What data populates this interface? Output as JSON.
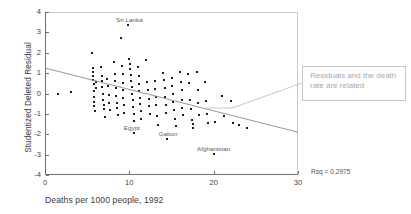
{
  "chart_data": {
    "type": "scatter",
    "title": "",
    "xlabel": "Deaths per 1000 people, 1992",
    "ylabel": "Studentized Deleted Residual",
    "xlim": [
      0,
      30
    ],
    "ylim": [
      -4,
      4
    ],
    "xticks": [
      0,
      10,
      20,
      30
    ],
    "yticks": [
      -4,
      -3,
      -2,
      -1,
      0,
      1,
      2,
      3,
      4
    ],
    "grid": false,
    "legend": null,
    "marker_color": "#1d1d1d",
    "fit_line": {
      "label": "regression fit",
      "x": [
        0,
        30
      ],
      "y": [
        1.25,
        -1.9
      ],
      "color": "#8a8a8a"
    },
    "statistics": {
      "rsq_label": "Rsq = 0.2975",
      "rsq_value": 0.2975
    },
    "point_labels": [
      {
        "text": "Sri Lanka",
        "x": 10.0,
        "y": 3.35
      },
      {
        "text": "Egypt",
        "x": 10.3,
        "y": -1.95
      },
      {
        "text": "Gabon",
        "x": 14.6,
        "y": -2.25
      },
      {
        "text": "Afghanistan",
        "x": 20.0,
        "y": -2.95
      }
    ],
    "points": [
      [
        1.6,
        0.0
      ],
      [
        3.1,
        0.05
      ],
      [
        5.6,
        2.0
      ],
      [
        5.7,
        1.25
      ],
      [
        5.7,
        1.05
      ],
      [
        5.7,
        0.85
      ],
      [
        5.7,
        0.65
      ],
      [
        5.8,
        0.45
      ],
      [
        5.8,
        0.1
      ],
      [
        5.8,
        -0.15
      ],
      [
        5.8,
        -0.4
      ],
      [
        5.8,
        -0.6
      ],
      [
        5.9,
        -0.85
      ],
      [
        6.0,
        0.55
      ],
      [
        6.1,
        0.25
      ],
      [
        6.6,
        1.3
      ],
      [
        6.7,
        0.85
      ],
      [
        6.8,
        0.6
      ],
      [
        6.8,
        0.3
      ],
      [
        6.9,
        0.0
      ],
      [
        6.9,
        -0.3
      ],
      [
        7.0,
        -0.55
      ],
      [
        7.0,
        -0.75
      ],
      [
        7.1,
        -1.15
      ],
      [
        7.4,
        0.7
      ],
      [
        7.5,
        0.35
      ],
      [
        7.6,
        -0.05
      ],
      [
        7.6,
        -0.45
      ],
      [
        7.7,
        -0.8
      ],
      [
        8.2,
        1.55
      ],
      [
        8.3,
        0.95
      ],
      [
        8.3,
        0.6
      ],
      [
        8.4,
        0.25
      ],
      [
        8.4,
        -0.1
      ],
      [
        8.5,
        -0.45
      ],
      [
        8.5,
        -0.7
      ],
      [
        8.6,
        -1.05
      ],
      [
        9.0,
        2.7
      ],
      [
        9.1,
        1.35
      ],
      [
        9.2,
        0.95
      ],
      [
        9.2,
        0.5
      ],
      [
        9.3,
        0.15
      ],
      [
        9.3,
        -0.2
      ],
      [
        9.4,
        -0.55
      ],
      [
        9.4,
        -0.95
      ],
      [
        9.9,
        3.35
      ],
      [
        10.0,
        1.7
      ],
      [
        10.1,
        1.45
      ],
      [
        10.1,
        1.2
      ],
      [
        10.2,
        0.9
      ],
      [
        10.2,
        0.6
      ],
      [
        10.3,
        0.3
      ],
      [
        10.3,
        0.0
      ],
      [
        10.4,
        -0.3
      ],
      [
        10.4,
        -0.65
      ],
      [
        10.5,
        -1.0
      ],
      [
        10.5,
        -1.35
      ],
      [
        10.6,
        -1.95
      ],
      [
        11.0,
        1.3
      ],
      [
        11.1,
        0.85
      ],
      [
        11.2,
        0.45
      ],
      [
        11.2,
        0.1
      ],
      [
        11.3,
        -0.2
      ],
      [
        11.3,
        -0.5
      ],
      [
        11.4,
        -0.85
      ],
      [
        11.4,
        -1.25
      ],
      [
        12.0,
        1.65
      ],
      [
        12.1,
        0.55
      ],
      [
        12.2,
        0.15
      ],
      [
        12.3,
        -0.25
      ],
      [
        12.3,
        -0.6
      ],
      [
        12.4,
        -1.0
      ],
      [
        13.0,
        0.6
      ],
      [
        13.1,
        0.2
      ],
      [
        13.2,
        -0.15
      ],
      [
        13.2,
        -0.55
      ],
      [
        13.3,
        -1.1
      ],
      [
        13.4,
        -1.55
      ],
      [
        14.0,
        1.0
      ],
      [
        14.1,
        0.65
      ],
      [
        14.2,
        0.25
      ],
      [
        14.2,
        -0.15
      ],
      [
        14.3,
        -0.55
      ],
      [
        14.4,
        -0.95
      ],
      [
        14.5,
        -2.25
      ],
      [
        15.0,
        0.75
      ],
      [
        15.1,
        0.35
      ],
      [
        15.2,
        0.0
      ],
      [
        15.2,
        -0.4
      ],
      [
        15.3,
        -0.8
      ],
      [
        15.4,
        -1.25
      ],
      [
        15.5,
        -1.6
      ],
      [
        16.0,
        1.05
      ],
      [
        16.1,
        0.55
      ],
      [
        16.2,
        0.15
      ],
      [
        16.2,
        -0.3
      ],
      [
        16.3,
        -0.7
      ],
      [
        16.4,
        -1.05
      ],
      [
        17.0,
        0.95
      ],
      [
        17.1,
        0.5
      ],
      [
        17.2,
        -0.3
      ],
      [
        17.3,
        -0.75
      ],
      [
        17.4,
        -1.3
      ],
      [
        17.5,
        -1.5
      ],
      [
        17.5,
        -1.7
      ],
      [
        18.0,
        1.05
      ],
      [
        18.1,
        0.15
      ],
      [
        18.2,
        -0.45
      ],
      [
        18.3,
        -1.05
      ],
      [
        19.0,
        0.55
      ],
      [
        19.1,
        -0.35
      ],
      [
        19.2,
        -1.0
      ],
      [
        19.3,
        -1.45
      ],
      [
        20.0,
        -2.95
      ],
      [
        20.2,
        -1.4
      ],
      [
        21.0,
        -0.1
      ],
      [
        21.2,
        -1.1
      ],
      [
        22.0,
        -0.35
      ],
      [
        22.3,
        -1.45
      ],
      [
        23.0,
        -1.55
      ],
      [
        24.0,
        -1.7
      ]
    ]
  },
  "annotation": {
    "text": "Residuals and the death rate are related",
    "border_color": "#c6c6c6",
    "text_color": "#a9a9a9"
  }
}
